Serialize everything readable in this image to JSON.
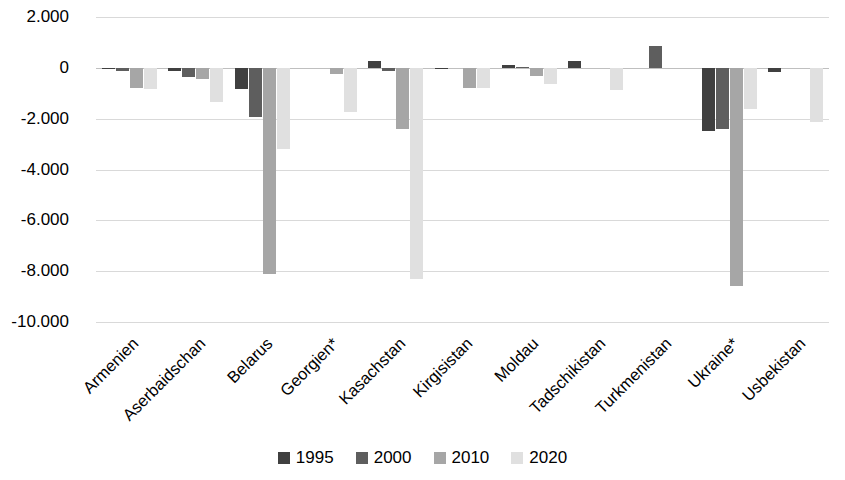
{
  "chart_data": {
    "type": "bar",
    "title": "",
    "subtitle": "",
    "xlabel": "",
    "ylabel": "",
    "ylim": [
      -10000,
      2000
    ],
    "ytick_labels": [
      "2.000",
      "0",
      "-2.000",
      "-4.000",
      "-6.000",
      "-8.000",
      "-10.000"
    ],
    "ytick_values": [
      2000,
      0,
      -2000,
      -4000,
      -6000,
      -8000,
      -10000
    ],
    "grid": true,
    "grid_axis": "y",
    "legend_position": "bottom",
    "orientation": "vertical",
    "categories": [
      "Armenien",
      "Aserbaidschan",
      "Belarus",
      "Georgien*",
      "Kasachstan",
      "Kirgisistan",
      "Moldau",
      "Tadschikistan",
      "Turkmenistan",
      "Ukraine*",
      "Usbekistan"
    ],
    "series": [
      {
        "name": "1995",
        "color": "#404040",
        "values": [
          -60,
          -120,
          -850,
          0,
          280,
          -60,
          110,
          250,
          0,
          -2500,
          -180
        ]
      },
      {
        "name": "2000",
        "color": "#5e5e5e",
        "values": [
          -130,
          -350,
          -1950,
          0,
          -130,
          0,
          40,
          0,
          850,
          -2400,
          0
        ]
      },
      {
        "name": "2010",
        "color": "#a6a6a6",
        "values": [
          -780,
          -450,
          -8120,
          -260,
          -2420,
          -780,
          -320,
          0,
          0,
          -8600,
          0
        ]
      },
      {
        "name": "2020",
        "color": "#e0e0e0",
        "values": [
          -830,
          -1350,
          -3180,
          -1750,
          -8300,
          -780,
          -650,
          -860,
          0,
          -1620,
          -2150
        ]
      }
    ]
  },
  "legend": {
    "items": [
      {
        "label": "1995",
        "color": "#404040"
      },
      {
        "label": "2000",
        "color": "#5e5e5e"
      },
      {
        "label": "2010",
        "color": "#a6a6a6"
      },
      {
        "label": "2020",
        "color": "#e0e0e0"
      }
    ]
  },
  "colors": {
    "gridline": "#d9d9d9",
    "zeroline": "#bfbfbf",
    "background": "#ffffff",
    "text": "#000000"
  }
}
